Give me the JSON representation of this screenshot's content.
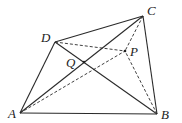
{
  "diagram": {
    "type": "geometry",
    "points": {
      "A": {
        "label": "A",
        "x": 20,
        "y": 113,
        "lx": 8,
        "ly": 118
      },
      "B": {
        "label": "B",
        "x": 157,
        "y": 114,
        "lx": 161,
        "ly": 119
      },
      "C": {
        "label": "C",
        "x": 143,
        "y": 16,
        "lx": 147,
        "ly": 15
      },
      "D": {
        "label": "D",
        "x": 55,
        "y": 42,
        "lx": 41,
        "ly": 42
      },
      "P": {
        "label": "P",
        "x": 125,
        "y": 51,
        "lx": 130,
        "ly": 56
      },
      "Q": {
        "label": "Q",
        "x": 84,
        "y": 62,
        "lx": 66,
        "ly": 67
      }
    },
    "solid_segments": [
      [
        "A",
        "B"
      ],
      [
        "B",
        "C"
      ],
      [
        "C",
        "D"
      ],
      [
        "D",
        "A"
      ],
      [
        "A",
        "C"
      ],
      [
        "D",
        "B"
      ]
    ],
    "dashed_segments": [
      [
        "D",
        "P"
      ],
      [
        "A",
        "P"
      ],
      [
        "C",
        "P"
      ],
      [
        "B",
        "P"
      ]
    ]
  }
}
